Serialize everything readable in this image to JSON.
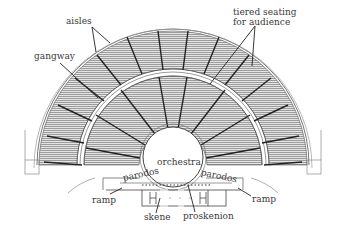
{
  "diagram": {
    "labels": {
      "aisles": "aisles",
      "gangway": "gangway",
      "tiered_seating": "tiered seating",
      "for_audience": "for audience",
      "orchestra": "orchestra",
      "parodos_left": "parodos",
      "parodos_right": "parodos",
      "ramp_left": "ramp",
      "ramp_right": "ramp",
      "skene": "skene",
      "proskenion": "proskenion"
    },
    "colors": {
      "ink": "#2a2a2a",
      "hatch": "#8a8a8a",
      "seat_fill": "#d6d6d6",
      "background": "#ffffff"
    }
  }
}
